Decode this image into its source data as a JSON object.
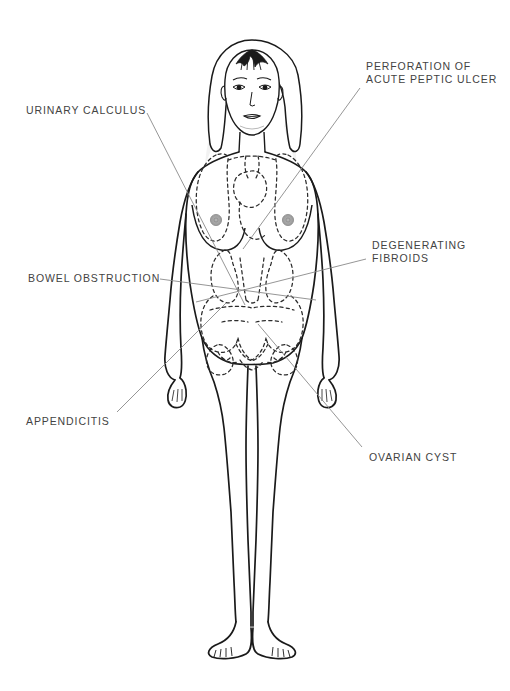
{
  "diagram": {
    "figure_name": "female-anatomy-front-view",
    "colors": {
      "outline": "#1a1a1a",
      "organ_dashed": "#2b2b2b",
      "leader_line": "#8a8a8a",
      "label_text": "#434343",
      "shading": "#dcdcdc",
      "nipple": "#9a9a9a",
      "background": "#ffffff"
    },
    "labels": [
      {
        "id": "urinary-calculus",
        "text": "URINARY CALCULUS",
        "side": "left",
        "x": 26,
        "y": 104,
        "lines": 1,
        "leader": {
          "x1": 147,
          "y1": 113,
          "x2": 245,
          "y2": 305
        }
      },
      {
        "id": "perforation-acute-peptic-ulcer",
        "text": "PERFORATION OF\nACUTE PEPTIC ULCER",
        "side": "right",
        "x": 366,
        "y": 60,
        "lines": 2,
        "leader": {
          "x1": 360,
          "y1": 88,
          "x2": 243,
          "y2": 249
        }
      },
      {
        "id": "degenerating-fibroids",
        "text": "DEGENERATING\nFIBROIDS",
        "side": "right",
        "x": 372,
        "y": 239,
        "lines": 2,
        "leader": {
          "x1": 366,
          "y1": 259,
          "x2": 196,
          "y2": 302
        }
      },
      {
        "id": "bowel-obstruction",
        "text": "BOWEL OBSTRUCTION",
        "side": "left",
        "x": 28,
        "y": 272,
        "lines": 1,
        "leader": {
          "x1": 160,
          "y1": 279,
          "x2": 316,
          "y2": 300
        }
      },
      {
        "id": "appendicitis",
        "text": "APPENDICITIS",
        "side": "left",
        "x": 26,
        "y": 415,
        "lines": 1,
        "leader": {
          "x1": 117,
          "y1": 412,
          "x2": 226,
          "y2": 303
        }
      },
      {
        "id": "ovarian-cyst",
        "text": "OVARIAN CYST",
        "side": "right",
        "x": 369,
        "y": 451,
        "lines": 1,
        "leader": {
          "x1": 362,
          "y1": 447,
          "x2": 258,
          "y2": 324
        }
      }
    ],
    "organ_regions": [
      {
        "name": "lungs-heart-dashed-region",
        "location": "thorax"
      },
      {
        "name": "kidneys-dashed-region",
        "location": "upper-abdomen"
      },
      {
        "name": "intestines-dashed-region",
        "location": "lower-abdomen"
      },
      {
        "name": "pelvic-organs-dashed-region",
        "location": "pelvis"
      }
    ],
    "body_parts": [
      {
        "name": "head"
      },
      {
        "name": "hair"
      },
      {
        "name": "left-eye"
      },
      {
        "name": "right-eye"
      },
      {
        "name": "nose"
      },
      {
        "name": "mouth"
      },
      {
        "name": "neck"
      },
      {
        "name": "torso"
      },
      {
        "name": "left-breast"
      },
      {
        "name": "right-breast"
      },
      {
        "name": "left-arm"
      },
      {
        "name": "right-arm"
      },
      {
        "name": "left-hand"
      },
      {
        "name": "right-hand"
      },
      {
        "name": "pubic-region"
      },
      {
        "name": "left-leg"
      },
      {
        "name": "right-leg"
      },
      {
        "name": "left-foot"
      },
      {
        "name": "right-foot"
      }
    ]
  }
}
